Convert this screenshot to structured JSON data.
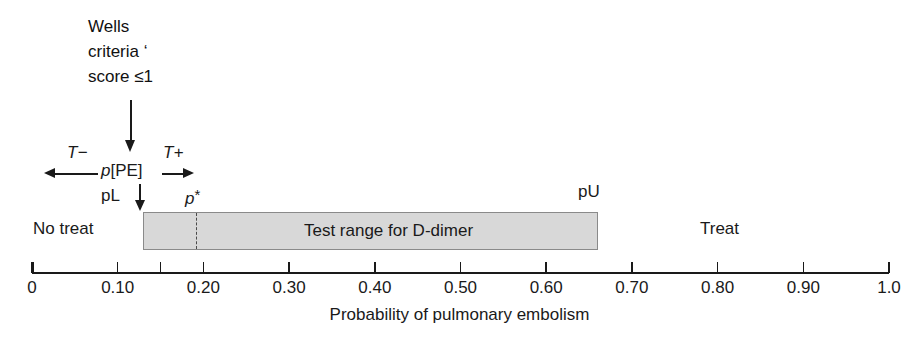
{
  "figure": {
    "annotation_block": "Wells\ncriteria ‘\nscore ≤1",
    "axis_title": "Probability of pulmonary embolism",
    "regions": {
      "no_treat": "No treat",
      "treat": "Treat",
      "test_range": "Test range for D-dimer"
    },
    "markers": {
      "p_pe_prefix": "p",
      "p_pe_bracket": "[PE]",
      "t_minus": "T−",
      "t_plus": "T+",
      "p_lower": "pL",
      "p_upper": "pU",
      "p_star": "p",
      "p_star_suffix": "*"
    },
    "colors": {
      "box_fill": "#d8d8d8",
      "box_border": "#8a8a8a",
      "ink": "#1a1a1a",
      "background": "#ffffff"
    }
  },
  "chart_data": {
    "type": "bar",
    "title": "",
    "xlabel": "Probability of pulmonary embolism",
    "ylabel": "",
    "xlim": [
      0,
      1.0
    ],
    "grid": false,
    "legend": "none",
    "orientation": "horizontal-number-line",
    "tick_values": [
      0,
      0.1,
      0.15,
      0.2,
      0.3,
      0.4,
      0.5,
      0.6,
      0.7,
      0.8,
      0.9,
      1.0
    ],
    "tick_labels": [
      "0",
      "0.10",
      "",
      "0.20",
      "0.30",
      "0.40",
      "0.50",
      "0.60",
      "0.70",
      "0.80",
      "0.90",
      "1.0"
    ],
    "thresholds": [
      {
        "name": "pL",
        "label": "pL",
        "value": 0.13,
        "description": "lower testing threshold / left edge of test range"
      },
      {
        "name": "p*",
        "label": "p*",
        "value": 0.19,
        "description": "treatment threshold, dashed line inside test range"
      },
      {
        "name": "pU",
        "label": "pU",
        "value": 0.66,
        "description": "upper testing threshold / right edge of test range"
      }
    ],
    "bands": [
      {
        "label": "No treat",
        "range": [
          0,
          0.13
        ],
        "fill": "none"
      },
      {
        "label": "Test range for D-dimer",
        "range": [
          0.13,
          0.66
        ],
        "fill": "#d8d8d8"
      },
      {
        "label": "Treat",
        "range": [
          0.66,
          1.0
        ],
        "fill": "none"
      }
    ],
    "annotations": [
      {
        "text": "Wells criteria ‘ score ≤1",
        "points_to": 0.107,
        "type": "arrow-down"
      },
      {
        "text": "p[PE]",
        "value": 0.107,
        "type": "point-estimate"
      },
      {
        "text": "T−",
        "direction": "left",
        "description": "negative test shifts probability left"
      },
      {
        "text": "T+",
        "direction": "right",
        "description": "positive test shifts probability right"
      }
    ]
  }
}
